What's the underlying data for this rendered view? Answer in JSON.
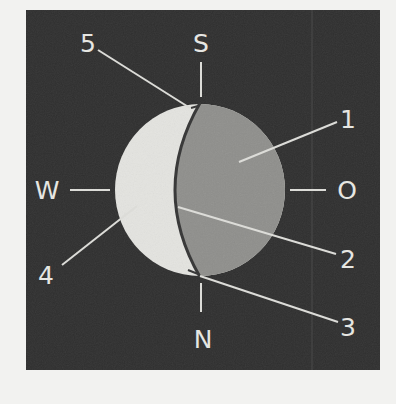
{
  "diagram": {
    "type": "moon-phase-orientation",
    "colors": {
      "page_background": "#f2f2f0",
      "panel_background": "#2f2f2f",
      "lit_side": "#e4e4e0",
      "dark_side": "#8f8f8c",
      "terminator": "#3a3a3a",
      "lines": "#dcdcd8",
      "labels": "#e6e6e2"
    },
    "compass": {
      "top": "S",
      "bottom": "N",
      "left": "W",
      "right": "O"
    },
    "callouts": [
      {
        "number": "1",
        "points_to": "dark (unlit) region of disk"
      },
      {
        "number": "2",
        "points_to": "terminator midpoint"
      },
      {
        "number": "3",
        "points_to": "lower cusp"
      },
      {
        "number": "4",
        "points_to": "lit crescent"
      },
      {
        "number": "5",
        "points_to": "upper cusp"
      }
    ]
  }
}
